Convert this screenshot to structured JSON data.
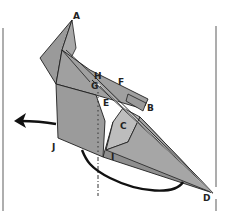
{
  "diagram": {
    "type": "origami-fold-step",
    "colors": {
      "paper_dark": "#8f8f8f",
      "paper_mid": "#a3a3a3",
      "paper_light": "#bdbdbd",
      "line": "#1e1e1e",
      "guide_line": "#8a8a8a",
      "background": "#ffffff"
    },
    "labels": {
      "A": "A",
      "B": "B",
      "C": "C",
      "D": "D",
      "E": "E",
      "F": "F",
      "G": "G",
      "H": "H",
      "I": "I",
      "J": "J"
    },
    "arrows": [
      {
        "name": "swing-flap-left-arrow",
        "direction": "left"
      }
    ],
    "guides": [
      {
        "name": "left-border-line"
      },
      {
        "name": "right-border-line"
      },
      {
        "name": "valley-fold-dotted-line"
      }
    ]
  }
}
